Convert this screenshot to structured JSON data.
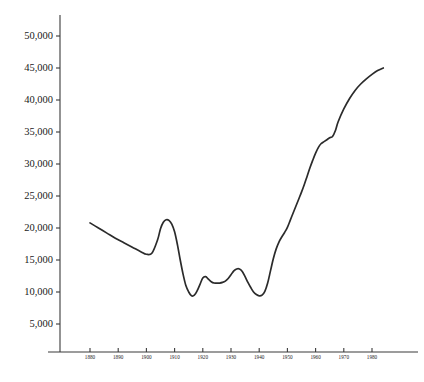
{
  "chart_data": {
    "type": "line",
    "title": "",
    "subtitle": "",
    "xlabel": "",
    "ylabel": "",
    "grid": false,
    "legend": false,
    "legend_position": "none",
    "line_color": "#2b2b2b",
    "axis_color": "#3a3a3a",
    "background_color": "#ffffff",
    "xlim": [
      1874,
      1985
    ],
    "ylim": [
      0,
      52000
    ],
    "y_ticks": [
      5000,
      10000,
      15000,
      20000,
      25000,
      30000,
      35000,
      40000,
      45000,
      50000
    ],
    "y_tick_labels": [
      "5,000",
      "10,000",
      "15,000",
      "20,000",
      "25,000",
      "30,000",
      "35,000",
      "40,000",
      "45,000",
      "50,000"
    ],
    "x_ticks": [
      1880,
      1890,
      1900,
      1910,
      1920,
      1930,
      1940,
      1950,
      1960,
      1970,
      1980
    ],
    "x_tick_labels": [
      "1880",
      "1890",
      "1900",
      "1910",
      "1920",
      "1930",
      "1940",
      "1950",
      "1960",
      "1970",
      "1980"
    ],
    "series": [
      {
        "name": "series-1",
        "x": [
          1880,
          1883,
          1886,
          1889,
          1892,
          1895,
          1898,
          1900,
          1902,
          1904,
          1905,
          1906,
          1907,
          1908,
          1909,
          1910,
          1911,
          1912,
          1913,
          1914,
          1915,
          1916,
          1917,
          1918,
          1919,
          1920,
          1921,
          1922,
          1923,
          1924,
          1925,
          1926,
          1927,
          1928,
          1929,
          1930,
          1931,
          1932,
          1933,
          1934,
          1935,
          1936,
          1937,
          1938,
          1939,
          1940,
          1941,
          1942,
          1943,
          1944,
          1945,
          1946,
          1947,
          1948,
          1949,
          1950,
          1951,
          1952,
          1953,
          1954,
          1955,
          1956,
          1957,
          1958,
          1959,
          1960,
          1961,
          1962,
          1963,
          1964,
          1965,
          1966,
          1967,
          1968,
          1970,
          1972,
          1974,
          1976,
          1978,
          1980,
          1982,
          1984
        ],
        "y": [
          20800,
          20000,
          19200,
          18400,
          17700,
          17000,
          16300,
          15900,
          16100,
          18200,
          19900,
          20900,
          21300,
          21200,
          20600,
          19400,
          17400,
          15000,
          12800,
          11000,
          10000,
          9400,
          9500,
          10200,
          11200,
          12200,
          12400,
          12000,
          11600,
          11400,
          11400,
          11400,
          11500,
          11700,
          12100,
          12700,
          13300,
          13600,
          13600,
          13200,
          12400,
          11500,
          10700,
          10000,
          9600,
          9400,
          9500,
          10100,
          11400,
          13300,
          15200,
          16700,
          17800,
          18600,
          19300,
          20100,
          21200,
          22300,
          23400,
          24500,
          25600,
          26800,
          28100,
          29400,
          30600,
          31700,
          32600,
          33200,
          33500,
          33800,
          34100,
          34300,
          35200,
          36600,
          38600,
          40200,
          41500,
          42500,
          43300,
          44000,
          44600,
          45000
        ]
      }
    ]
  },
  "axes": {
    "y_axis_name": "y-axis",
    "x_axis_name": "x-axis"
  }
}
